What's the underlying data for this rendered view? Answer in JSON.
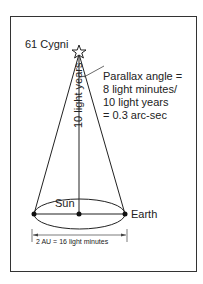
{
  "diagram": {
    "star": {
      "label": "61 Cygni"
    },
    "parallax_note": {
      "lines": [
        "Parallax angle =",
        "8 light minutes/",
        "10 light years",
        "= 0.3 arc-sec"
      ]
    },
    "distance_label": "10 light years",
    "sun_label": "Sun",
    "earth_label": "Earth",
    "baseline_label": "2 AU = 16 light minutes",
    "colors": {
      "line": "#222222",
      "frame": "#333333",
      "background": "#ffffff"
    }
  }
}
